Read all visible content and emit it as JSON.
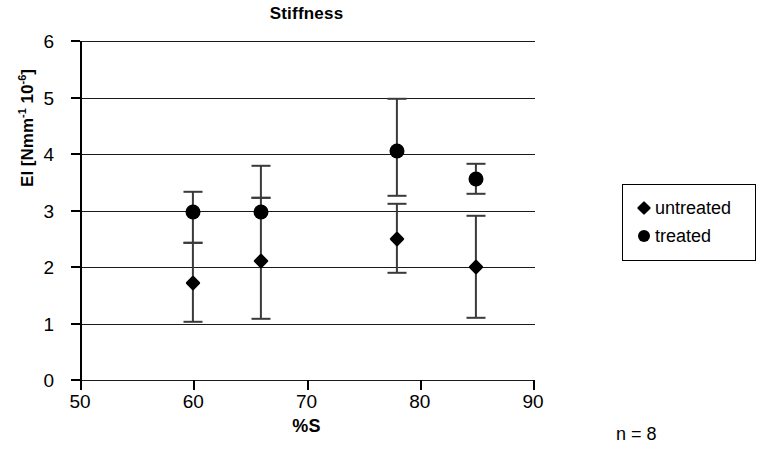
{
  "chart_data": {
    "type": "scatter",
    "title": "Stiffness",
    "xlabel": "%S",
    "ylabel": "EI [Nmm⁻¹ 10⁻⁶]",
    "ylabel_parts": {
      "prefix": "EI [Nmm",
      "sup1": "-1",
      "mid": " 10",
      "sup2": "-6",
      "suffix": "]"
    },
    "xlim": [
      50,
      90
    ],
    "ylim": [
      0,
      6
    ],
    "xticks": [
      50,
      60,
      70,
      80,
      90
    ],
    "yticks": [
      0,
      1,
      2,
      3,
      4,
      5,
      6
    ],
    "grid": "horizontal",
    "annotation": "n = 8",
    "legend_position": "right",
    "series": [
      {
        "name": "untreated",
        "marker": "diamond",
        "color": "#000000",
        "points": [
          {
            "x": 60,
            "y": 1.72,
            "err_low": 1.03,
            "err_high": 2.42
          },
          {
            "x": 66,
            "y": 2.1,
            "err_low": 1.08,
            "err_high": 3.22
          },
          {
            "x": 78,
            "y": 2.5,
            "err_low": 1.9,
            "err_high": 3.12
          },
          {
            "x": 85,
            "y": 2.0,
            "err_low": 1.1,
            "err_high": 2.9
          }
        ]
      },
      {
        "name": "treated",
        "marker": "circle",
        "color": "#000000",
        "points": [
          {
            "x": 60,
            "y": 2.98,
            "err_low": 2.42,
            "err_high": 3.32
          },
          {
            "x": 66,
            "y": 2.98,
            "err_low": 3.22,
            "err_high": 3.78
          },
          {
            "x": 78,
            "y": 4.05,
            "err_low": 3.25,
            "err_high": 4.98
          },
          {
            "x": 85,
            "y": 3.55,
            "err_low": 3.3,
            "err_high": 3.82
          }
        ]
      }
    ]
  },
  "legend": {
    "items": [
      {
        "label": "untreated",
        "marker": "diamond"
      },
      {
        "label": "treated",
        "marker": "circle"
      }
    ]
  }
}
